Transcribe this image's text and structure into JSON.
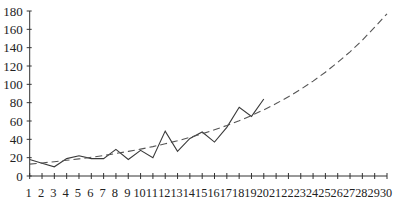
{
  "chart_data": {
    "type": "line",
    "title": "",
    "xlabel": "",
    "ylabel": "",
    "x": [
      1,
      2,
      3,
      4,
      5,
      6,
      7,
      8,
      9,
      10,
      11,
      12,
      13,
      14,
      15,
      16,
      17,
      18,
      19,
      20,
      21,
      22,
      23,
      24,
      25,
      26,
      27,
      28,
      29,
      30
    ],
    "xtick_labels": [
      "1",
      "2",
      "3",
      "4",
      "5",
      "6",
      "7",
      "8",
      "9",
      "10",
      "11",
      "12",
      "13",
      "14",
      "15",
      "16",
      "17",
      "18",
      "19",
      "20",
      "21",
      "22",
      "23",
      "24",
      "25",
      "26",
      "27",
      "28",
      "29",
      "30"
    ],
    "yticks": [
      0,
      20,
      40,
      60,
      80,
      100,
      120,
      140,
      160,
      180
    ],
    "ylim": [
      0,
      180
    ],
    "grid": false,
    "legend": null,
    "series": [
      {
        "name": "actual",
        "style": "solid",
        "x": [
          1,
          2,
          3,
          4,
          5,
          6,
          7,
          8,
          9,
          10,
          11,
          12,
          13,
          14,
          15,
          16,
          17,
          18,
          19,
          20
        ],
        "values": [
          18,
          14,
          10,
          19,
          22,
          19,
          19,
          29,
          18,
          28,
          20,
          49,
          27,
          41,
          48,
          37,
          53,
          75,
          65,
          84
        ]
      },
      {
        "name": "exponential trend",
        "style": "dashed",
        "formula": "y = 11.9 * exp(0.09 * x)",
        "x": [
          1,
          2,
          3,
          4,
          5,
          6,
          7,
          8,
          9,
          10,
          11,
          12,
          13,
          14,
          15,
          16,
          17,
          18,
          19,
          20,
          21,
          22,
          23,
          24,
          25,
          26,
          27,
          28,
          29,
          30
        ],
        "values": [
          13,
          14.2,
          15.6,
          17.1,
          18.7,
          20.4,
          22.4,
          24.5,
          26.8,
          29.3,
          32.1,
          35.1,
          38.4,
          42.1,
          46.0,
          50.4,
          55.1,
          60.3,
          66.0,
          72.2,
          79.0,
          86.4,
          94.6,
          103.5,
          113.2,
          123.9,
          135.5,
          148.3,
          162.3,
          177
        ]
      }
    ]
  }
}
